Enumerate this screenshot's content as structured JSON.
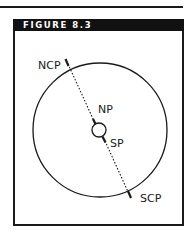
{
  "figure": {
    "title": "FIGURE 8.3",
    "colors": {
      "ink": "#1a1a1a",
      "header_bg": "#111111",
      "header_text": "#ffffff",
      "background": "#ffffff"
    }
  },
  "diagram": {
    "outer_circle": {
      "cx": 100,
      "cy": 130,
      "r": 67
    },
    "inner_circle": {
      "cx": 99,
      "cy": 130,
      "r": 7
    },
    "axis": {
      "style": "dotted",
      "from": [
        67,
        62
      ],
      "to": [
        130,
        197
      ]
    },
    "labels": {
      "ncp": "NCP",
      "np": "NP",
      "sp": "SP",
      "scp": "SCP"
    }
  }
}
